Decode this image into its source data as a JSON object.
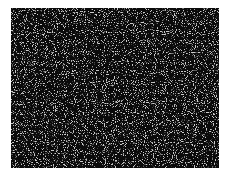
{
  "image": {
    "description": "random noise pattern",
    "background_color": "#ffffff",
    "panel_color": "#0a0a0a",
    "speckle_color": "#9a9a9a"
  }
}
